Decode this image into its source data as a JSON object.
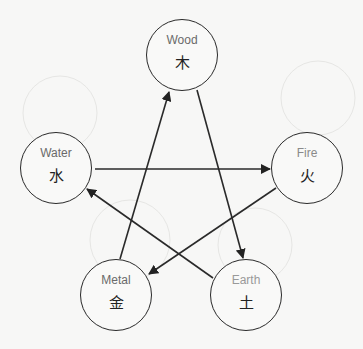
{
  "diagram": {
    "nodes": [
      {
        "id": "wood",
        "label": "Wood",
        "glyph": "木",
        "cx": 182,
        "cy": 55
      },
      {
        "id": "water",
        "label": "Water",
        "glyph": "水",
        "cx": 57,
        "cy": 168
      },
      {
        "id": "fire",
        "label": "Fire",
        "glyph": "火",
        "cx": 308,
        "cy": 168
      },
      {
        "id": "metal",
        "label": "Metal",
        "glyph": "金",
        "cx": 117,
        "cy": 295
      },
      {
        "id": "earth",
        "label": "Earth",
        "glyph": "土",
        "cx": 247,
        "cy": 295
      }
    ],
    "edges": [
      {
        "from": "Metal",
        "to": "Wood"
      },
      {
        "from": "Wood",
        "to": "Earth"
      },
      {
        "from": "Water",
        "to": "Fire"
      },
      {
        "from": "Fire",
        "to": "Metal"
      },
      {
        "from": "Earth",
        "to": "Water"
      }
    ],
    "colors": {
      "line": "#2a2a2a",
      "background": "#f7f7f6"
    }
  }
}
